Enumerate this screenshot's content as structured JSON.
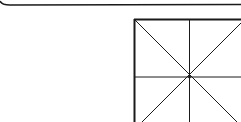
{
  "diagram": {
    "colors": {
      "stroke": "#1a1a1a",
      "background": "#ffffff"
    },
    "top_rule": {
      "y": 5,
      "curve_left": true
    },
    "grid_box": {
      "x": 134,
      "y": 19,
      "size": 116,
      "center": [
        189,
        77
      ]
    }
  }
}
